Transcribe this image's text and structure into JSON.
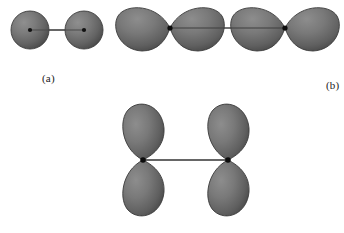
{
  "figure": {
    "width": 344,
    "height": 233,
    "background": "#ffffff",
    "orbital_fill_light": "#8a8a8a",
    "orbital_fill_mid": "#6e6e6e",
    "orbital_fill_dark": "#454545",
    "outline_color": "#3b3b3b",
    "nucleus_color": "#111111",
    "bond_line_color": "#5a5a5a"
  },
  "panels": [
    {
      "id": "a",
      "label": "(a)",
      "orbital_type": "s",
      "lobes_per_atom": 1,
      "atom_count": 2,
      "orientation": "horizontal",
      "nuclei": [
        {
          "x": 30,
          "y": 30
        },
        {
          "x": 84,
          "y": 30
        }
      ],
      "sphere_radius": 19,
      "bond": {
        "x1": 30,
        "y1": 30,
        "x2": 84,
        "y2": 30
      }
    },
    {
      "id": "b",
      "label": "(b)",
      "orbital_type": "p",
      "lobes_per_atom": 2,
      "atom_count": 2,
      "orientation": "horizontal",
      "nuclei": [
        {
          "x": 58,
          "y": 28
        },
        {
          "x": 173,
          "y": 28
        }
      ],
      "lobe_length": 54,
      "lobe_halfwidth": 21,
      "bond": {
        "x1": 58,
        "y1": 28,
        "x2": 173,
        "y2": 28
      }
    },
    {
      "id": "c",
      "label": "(c)",
      "orbital_type": "p",
      "lobes_per_atom": 2,
      "atom_count": 2,
      "orientation": "vertical",
      "nuclei": [
        {
          "x": 25,
          "y": 60
        },
        {
          "x": 110,
          "y": 60
        }
      ],
      "lobe_length": 50,
      "lobe_halfwidth": 21,
      "bond": {
        "x1": 25,
        "y1": 60,
        "x2": 110,
        "y2": 60
      }
    }
  ]
}
